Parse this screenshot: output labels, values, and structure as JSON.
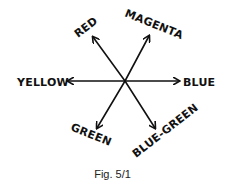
{
  "figure": {
    "caption": "Fig. 5/1",
    "center": [
      125,
      81
    ],
    "stroke_color": "#111111",
    "labels": {
      "red": "RED",
      "magenta": "MAGENTA",
      "yellow": "YELLOW",
      "blue": "BLUE",
      "green": "GREEN",
      "blue_green": "BLUE-GREEN"
    },
    "arrows": [
      {
        "name": "red",
        "to": [
          93,
          37
        ]
      },
      {
        "name": "magenta",
        "to": [
          149,
          36
        ]
      },
      {
        "name": "yellow",
        "to": [
          68,
          81
        ]
      },
      {
        "name": "blue",
        "to": [
          179,
          81
        ]
      },
      {
        "name": "green",
        "to": [
          97,
          128
        ]
      },
      {
        "name": "blue_green",
        "to": [
          155,
          128
        ]
      }
    ]
  }
}
